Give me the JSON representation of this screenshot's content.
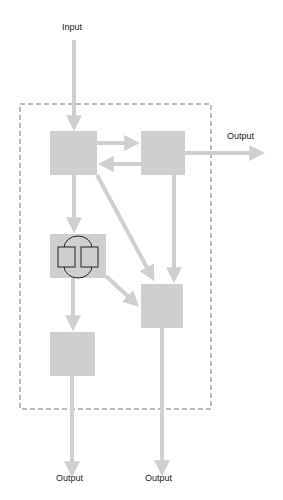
{
  "diagram": {
    "colors": {
      "box": "#cfcfcf",
      "arrow": "#cfcfcf",
      "border": "#555555",
      "icon": "#222222"
    },
    "labels": {
      "input": "Input",
      "output_right": "Output",
      "output_bottom_left": "Output",
      "output_bottom_right": "Output"
    },
    "nodes": [
      {
        "id": "A",
        "icon": "none"
      },
      {
        "id": "B",
        "icon": "none"
      },
      {
        "id": "C",
        "icon": "book-loop-icon"
      },
      {
        "id": "D",
        "icon": "none"
      },
      {
        "id": "E",
        "icon": "none"
      }
    ],
    "edges": [
      {
        "from": "Input",
        "to": "A"
      },
      {
        "from": "A",
        "to": "B"
      },
      {
        "from": "B",
        "to": "A"
      },
      {
        "from": "B",
        "to": "Output"
      },
      {
        "from": "A",
        "to": "C"
      },
      {
        "from": "A",
        "to": "D"
      },
      {
        "from": "B",
        "to": "D"
      },
      {
        "from": "C",
        "to": "D"
      },
      {
        "from": "C",
        "to": "E"
      },
      {
        "from": "E",
        "to": "Output"
      },
      {
        "from": "D",
        "to": "Output"
      }
    ]
  }
}
